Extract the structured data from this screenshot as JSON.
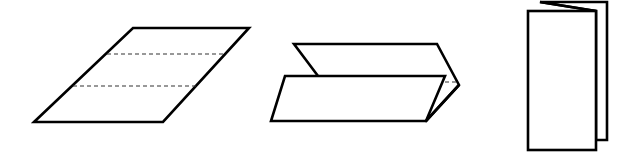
{
  "diagram": {
    "type": "paper-folding-steps",
    "stroke_color": "#000000",
    "background": "#ffffff",
    "steps": [
      {
        "name": "unfolded-sheet",
        "description": "Flat sheet (drawn in perspective) with two dashed fold lines dividing it into three panels",
        "outline": [
          [
            34,
            122
          ],
          [
            133,
            28
          ],
          [
            249,
            28
          ],
          [
            163,
            122
          ]
        ],
        "fold_lines": [
          {
            "from": [
              107,
              54
            ],
            "to": [
              225,
              54
            ],
            "style": "dashed"
          },
          {
            "from": [
              73,
              86
            ],
            "to": [
              196,
              86
            ],
            "style": "dashed"
          }
        ]
      },
      {
        "name": "partially-folded-sheet",
        "description": "Sheet being folded into a Z (accordion) fold",
        "back_panel": [
          [
            294,
            44
          ],
          [
            437,
            44
          ],
          [
            459,
            85
          ],
          [
            426,
            121
          ]
        ],
        "front_panel": [
          [
            285,
            76
          ],
          [
            445,
            76
          ],
          [
            426,
            121
          ],
          [
            271,
            121
          ]
        ],
        "hidden_edge": {
          "from": [
            445,
            82
          ],
          "to": [
            458,
            82
          ],
          "style": "dashed"
        }
      },
      {
        "name": "folded-leaflet",
        "description": "Fully folded tri-fold leaflet standing upright",
        "front_panel": [
          [
            528,
            11
          ],
          [
            596,
            11
          ],
          [
            596,
            150
          ],
          [
            528,
            150
          ]
        ],
        "back_panel": [
          [
            540,
            2
          ],
          [
            607,
            2
          ],
          [
            607,
            140
          ],
          [
            596,
            140
          ]
        ]
      }
    ]
  }
}
